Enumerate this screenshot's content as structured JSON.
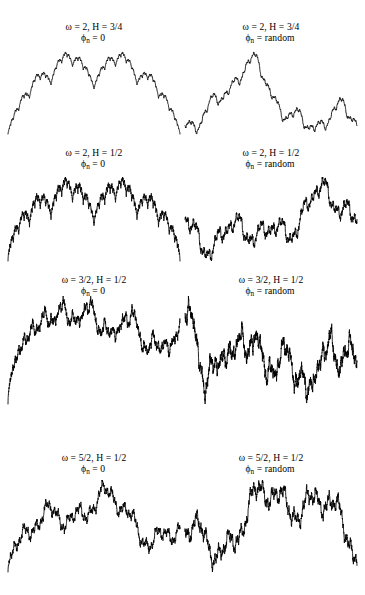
{
  "figure": {
    "background_color": "#ffffff",
    "curve_color": "#000000",
    "width": 365,
    "height": 595,
    "columns": 2,
    "rows": 4
  },
  "panels": [
    {
      "id": "panel-1",
      "caption_line1": "ω = 2, H = 3/4",
      "caption_line2_prefix": "ϕ",
      "caption_line2_sub": "n",
      "caption_line2_rest": " = 0",
      "omega": 2,
      "H": 0.75,
      "phase": "0",
      "column": "left",
      "row": 1
    },
    {
      "id": "panel-2",
      "caption_line1": "ω = 2, H = 3/4",
      "caption_line2_prefix": "ϕ",
      "caption_line2_sub": "n",
      "caption_line2_rest": " = random",
      "omega": 2,
      "H": 0.75,
      "phase": "random",
      "column": "right",
      "row": 1
    },
    {
      "id": "panel-3",
      "caption_line1": "ω = 2, H = 1/2",
      "caption_line2_prefix": "ϕ",
      "caption_line2_sub": "n",
      "caption_line2_rest": " = 0",
      "omega": 2,
      "H": 0.5,
      "phase": "0",
      "column": "left",
      "row": 2
    },
    {
      "id": "panel-4",
      "caption_line1": "ω = 2, H = 1/2",
      "caption_line2_prefix": "ϕ",
      "caption_line2_sub": "n",
      "caption_line2_rest": " = random",
      "omega": 2,
      "H": 0.5,
      "phase": "random",
      "column": "right",
      "row": 2
    },
    {
      "id": "panel-5",
      "caption_line1": "ω = 3/2, H = 1/2",
      "caption_line2_prefix": "ϕ",
      "caption_line2_sub": "n",
      "caption_line2_rest": " = 0",
      "omega": 1.5,
      "H": 0.5,
      "phase": "0",
      "column": "left",
      "row": 3
    },
    {
      "id": "panel-6",
      "caption_line1": "ω = 3/2, H = 1/2",
      "caption_line2_prefix": "ϕ",
      "caption_line2_sub": "n",
      "caption_line2_rest": " = random",
      "omega": 1.5,
      "H": 0.5,
      "phase": "random",
      "column": "right",
      "row": 3
    },
    {
      "id": "panel-7",
      "caption_line1": "ω = 5/2, H = 1/2",
      "caption_line2_prefix": "ϕ",
      "caption_line2_sub": "n",
      "caption_line2_rest": " = 0",
      "omega": 2.5,
      "H": 0.5,
      "phase": "0",
      "column": "left",
      "row": 4
    },
    {
      "id": "panel-8",
      "caption_line1": "ω = 5/2, H = 1/2",
      "caption_line2_prefix": "ϕ",
      "caption_line2_sub": "n",
      "caption_line2_rest": " = random",
      "omega": 2.5,
      "H": 0.5,
      "phase": "random",
      "column": "right",
      "row": 4
    }
  ],
  "chart_data": {
    "type": "line",
    "xlabel": "",
    "ylabel": "",
    "grid": false,
    "legend": "none",
    "series": [
      {
        "name": "ω = 2, H = 3/4, ϕn = 0",
        "omega": 2,
        "H": 0.75,
        "phase_mode": "zero",
        "n_terms": 12,
        "panel": "panel-1"
      },
      {
        "name": "ω = 2, H = 3/4, ϕn = random",
        "omega": 2,
        "H": 0.75,
        "phase_mode": "random",
        "n_terms": 12,
        "panel": "panel-2"
      },
      {
        "name": "ω = 2, H = 1/2, ϕn = 0",
        "omega": 2,
        "H": 0.5,
        "phase_mode": "zero",
        "n_terms": 12,
        "panel": "panel-3"
      },
      {
        "name": "ω = 2, H = 1/2, ϕn = random",
        "omega": 2,
        "H": 0.5,
        "phase_mode": "random",
        "n_terms": 12,
        "panel": "panel-4"
      },
      {
        "name": "ω = 3/2, H = 1/2, ϕn = 0",
        "omega": 1.5,
        "H": 0.5,
        "phase_mode": "zero",
        "n_terms": 22,
        "panel": "panel-5"
      },
      {
        "name": "ω = 3/2, H = 1/2, ϕn = random",
        "omega": 1.5,
        "H": 0.5,
        "phase_mode": "random",
        "n_terms": 22,
        "panel": "panel-6"
      },
      {
        "name": "ω = 5/2, H = 1/2, ϕn = 0",
        "omega": 2.5,
        "H": 0.5,
        "phase_mode": "zero",
        "n_terms": 11,
        "panel": "panel-7"
      },
      {
        "name": "ω = 5/2, H = 1/2, ϕn = random",
        "omega": 2.5,
        "H": 0.5,
        "phase_mode": "random",
        "n_terms": 11,
        "panel": "panel-8"
      }
    ]
  }
}
